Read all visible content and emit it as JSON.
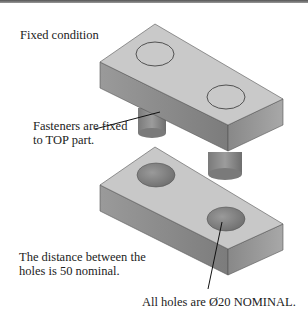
{
  "figure": {
    "title": "Fixed condition",
    "callouts": [
      {
        "id": "fasteners",
        "lines": [
          "Fasteners are fixed",
          "to TOP part."
        ]
      },
      {
        "id": "distance",
        "lines": [
          "The distance between the",
          "holes is 50 nominal."
        ]
      },
      {
        "id": "holes",
        "lines": [
          "All holes are Ø20 NOMINAL."
        ]
      }
    ],
    "parts": [
      {
        "name": "top-part",
        "features": [
          "fastener-1",
          "fastener-2"
        ]
      },
      {
        "name": "bottom-part",
        "features": [
          "hole-1",
          "hole-2"
        ]
      }
    ],
    "colors": {
      "top_face": "#c9c9c9",
      "side_face_left": "#8a8a8a",
      "side_face_right": "#a6a6a6",
      "hole_inner": "#7e7e7e",
      "outline": "#444444"
    }
  }
}
